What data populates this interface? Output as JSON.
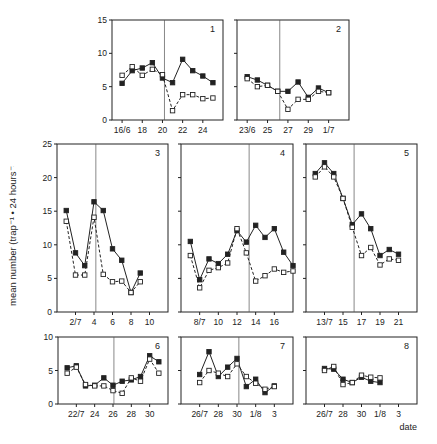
{
  "figure": {
    "ylabel": "mean number (trap⁻¹ • 24 hours⁻¹)",
    "xlabel": "date",
    "legend": [
      {
        "name": "filled squares, solid line",
        "marker": "filled-square"
      },
      {
        "name": "open squares, dashed line",
        "marker": "open-square"
      }
    ]
  },
  "chart_data": [
    {
      "type": "line",
      "title": "1",
      "panel": 1,
      "xlim": [
        15,
        26
      ],
      "ylim": [
        0,
        15
      ],
      "yticks": [
        0,
        5,
        10,
        15
      ],
      "xticks": [
        {
          "x": 16,
          "label": "16/6"
        },
        {
          "x": 18,
          "label": "18"
        },
        {
          "x": 20,
          "label": "20"
        },
        {
          "x": 22,
          "label": "22"
        },
        {
          "x": 24,
          "label": "24"
        }
      ],
      "vline": 20.2,
      "x": [
        16,
        17,
        18,
        19,
        20,
        21,
        22,
        23,
        24,
        25
      ],
      "series": [
        {
          "name": "filled",
          "values": [
            5.5,
            7.4,
            7.8,
            8.6,
            6.3,
            5.6,
            9.1,
            7.4,
            6.6,
            5.6
          ]
        },
        {
          "name": "open",
          "values": [
            6.7,
            8.0,
            6.7,
            7.6,
            6.8,
            1.4,
            3.8,
            3.8,
            3.2,
            3.3
          ]
        }
      ]
    },
    {
      "type": "line",
      "title": "2",
      "panel": 2,
      "xlim": [
        22,
        33
      ],
      "ylim": [
        0,
        15
      ],
      "yticks": [
        0,
        5,
        10,
        15
      ],
      "xticks": [
        {
          "x": 23,
          "label": "23/6"
        },
        {
          "x": 25,
          "label": "25"
        },
        {
          "x": 27,
          "label": "27"
        },
        {
          "x": 29,
          "label": "29"
        },
        {
          "x": 31,
          "label": "1/7"
        }
      ],
      "vline": 26.2,
      "x": [
        23,
        24,
        25,
        26,
        27,
        28,
        29,
        30,
        31
      ],
      "series": [
        {
          "name": "filled",
          "values": [
            6.5,
            6.0,
            5.2,
            4.3,
            4.3,
            5.7,
            3.4,
            4.8,
            4.1
          ]
        },
        {
          "name": "open",
          "values": [
            6.2,
            5.0,
            5.2,
            4.3,
            1.6,
            3.1,
            3.1,
            4.3,
            4.1
          ]
        }
      ]
    },
    {
      "type": "line",
      "title": "3",
      "panel": 3,
      "xlim": [
        0,
        12
      ],
      "ylim": [
        0,
        25
      ],
      "yticks": [
        0,
        5,
        10,
        15,
        20,
        25
      ],
      "xticks": [
        {
          "x": 2,
          "label": "2/7"
        },
        {
          "x": 4,
          "label": "4"
        },
        {
          "x": 6,
          "label": "6"
        },
        {
          "x": 8,
          "label": "8"
        },
        {
          "x": 10,
          "label": "10"
        }
      ],
      "vline": 4.2,
      "x": [
        1,
        2,
        3,
        4,
        5,
        6,
        7,
        8,
        9
      ],
      "series": [
        {
          "name": "filled",
          "values": [
            15.1,
            8.8,
            6.9,
            16.4,
            15.1,
            9.4,
            7.7,
            2.9,
            5.8
          ]
        },
        {
          "name": "open",
          "values": [
            13.5,
            5.5,
            5.5,
            14.1,
            5.6,
            4.5,
            4.6,
            2.9,
            4.5
          ]
        }
      ]
    },
    {
      "type": "line",
      "title": "4",
      "panel": 4,
      "xlim": [
        6,
        18
      ],
      "ylim": [
        0,
        25
      ],
      "yticks": [
        0,
        5,
        10,
        15,
        20,
        25
      ],
      "xticks": [
        {
          "x": 8,
          "label": "8/7"
        },
        {
          "x": 10,
          "label": "10"
        },
        {
          "x": 12,
          "label": "12"
        },
        {
          "x": 14,
          "label": "14"
        },
        {
          "x": 16,
          "label": "16"
        }
      ],
      "vline": 13.3,
      "x": [
        7,
        8,
        9,
        10,
        11,
        12,
        13,
        14,
        15,
        16,
        17,
        18
      ],
      "series": [
        {
          "name": "filled",
          "values": [
            10.5,
            4.8,
            7.9,
            7.2,
            8.6,
            12.1,
            10.4,
            12.9,
            11.1,
            12.4,
            8.9,
            6.9
          ]
        },
        {
          "name": "open",
          "values": [
            8.4,
            3.6,
            6.2,
            6.6,
            7.3,
            12.4,
            8.8,
            4.6,
            5.4,
            6.4,
            5.9,
            6.1
          ]
        }
      ]
    },
    {
      "type": "line",
      "title": "5",
      "panel": 5,
      "xlim": [
        11,
        23
      ],
      "ylim": [
        0,
        25
      ],
      "yticks": [
        0,
        5,
        10,
        15,
        20,
        25
      ],
      "xticks": [
        {
          "x": 13,
          "label": "13/7"
        },
        {
          "x": 15,
          "label": "15"
        },
        {
          "x": 17,
          "label": "17"
        },
        {
          "x": 19,
          "label": "19"
        },
        {
          "x": 21,
          "label": "21"
        }
      ],
      "vline": 16.2,
      "x": [
        12,
        13,
        14,
        15,
        16,
        17,
        18,
        19,
        20,
        21
      ],
      "series": [
        {
          "name": "filled",
          "values": [
            20.6,
            22.2,
            20.6,
            16.9,
            13.0,
            14.6,
            12.4,
            8.4,
            9.3,
            8.6
          ]
        },
        {
          "name": "open",
          "values": [
            20.1,
            21.6,
            20.1,
            16.9,
            12.6,
            8.4,
            9.6,
            7.0,
            7.9,
            7.7
          ]
        }
      ]
    },
    {
      "type": "line",
      "title": "6",
      "panel": 6,
      "xlim": [
        20,
        32
      ],
      "ylim": [
        0,
        10
      ],
      "yticks": [
        0,
        5,
        10
      ],
      "xticks": [
        {
          "x": 22,
          "label": "22/7"
        },
        {
          "x": 24,
          "label": "24"
        },
        {
          "x": 26,
          "label": "26"
        },
        {
          "x": 28,
          "label": "28"
        },
        {
          "x": 30,
          "label": "30"
        }
      ],
      "vline": 26.1,
      "x": [
        21,
        22,
        23,
        24,
        25,
        26,
        27,
        28,
        29,
        30,
        31
      ],
      "series": [
        {
          "name": "filled",
          "values": [
            5.4,
            5.7,
            2.7,
            2.8,
            3.9,
            2.8,
            3.4,
            3.6,
            4.1,
            7.2,
            6.3
          ]
        },
        {
          "name": "open",
          "values": [
            4.6,
            5.5,
            2.9,
            2.7,
            2.7,
            2.0,
            1.6,
            3.9,
            3.4,
            6.7,
            4.6
          ]
        }
      ]
    },
    {
      "type": "line",
      "title": "7",
      "panel": 7,
      "xlim": [
        24,
        36
      ],
      "ylim": [
        0,
        10
      ],
      "yticks": [
        0,
        5,
        10
      ],
      "xticks": [
        {
          "x": 26,
          "label": "26/7"
        },
        {
          "x": 28,
          "label": "28"
        },
        {
          "x": 30,
          "label": "30"
        },
        {
          "x": 32,
          "label": "1/8"
        },
        {
          "x": 34,
          "label": "3"
        }
      ],
      "vline": 30.2,
      "x": [
        26,
        27,
        28,
        29,
        30,
        31,
        32,
        33,
        34
      ],
      "series": [
        {
          "name": "filled",
          "values": [
            4.4,
            7.8,
            4.1,
            5.5,
            6.8,
            2.6,
            3.7,
            1.7,
            2.7
          ]
        },
        {
          "name": "open",
          "values": [
            3.2,
            5.0,
            4.6,
            4.1,
            6.0,
            4.1,
            3.1,
            2.2,
            2.6
          ]
        }
      ]
    },
    {
      "type": "line",
      "title": "8",
      "panel": 8,
      "xlim": [
        24,
        36
      ],
      "ylim": [
        0,
        10
      ],
      "yticks": [
        0,
        5,
        10
      ],
      "xticks": [
        {
          "x": 26,
          "label": "26/7"
        },
        {
          "x": 28,
          "label": "28"
        },
        {
          "x": 30,
          "label": "30"
        },
        {
          "x": 32,
          "label": "1/8"
        },
        {
          "x": 34,
          "label": "3"
        }
      ],
      "vline": null,
      "x": [
        26,
        27,
        28,
        29,
        30,
        31,
        32
      ],
      "series": [
        {
          "name": "filled",
          "values": [
            5.3,
            5.2,
            3.7,
            3.2,
            4.0,
            3.4,
            3.2
          ]
        },
        {
          "name": "open",
          "values": [
            5.0,
            5.6,
            2.9,
            3.2,
            4.3,
            4.0,
            3.9
          ]
        }
      ]
    }
  ],
  "layout": {
    "panels": [
      {
        "x0": 112,
        "x1": 223,
        "y0": 20,
        "y1": 120
      },
      {
        "x0": 237,
        "x1": 349,
        "y0": 20,
        "y1": 120
      },
      {
        "x0": 57,
        "x1": 168,
        "y0": 144,
        "y1": 312
      },
      {
        "x0": 181,
        "x1": 293,
        "y0": 144,
        "y1": 312
      },
      {
        "x0": 306,
        "x1": 417,
        "y0": 144,
        "y1": 312
      },
      {
        "x0": 58,
        "x1": 168,
        "y0": 337,
        "y1": 404
      },
      {
        "x0": 181,
        "x1": 293,
        "y0": 337,
        "y1": 404
      },
      {
        "x0": 306,
        "x1": 417,
        "y0": 337,
        "y1": 404
      }
    ],
    "yticklabels_on": [
      true,
      false,
      true,
      false,
      false,
      true,
      false,
      false
    ],
    "colors": {
      "ink": "#222222",
      "vline": "#555555",
      "background": "#ffffff"
    }
  }
}
